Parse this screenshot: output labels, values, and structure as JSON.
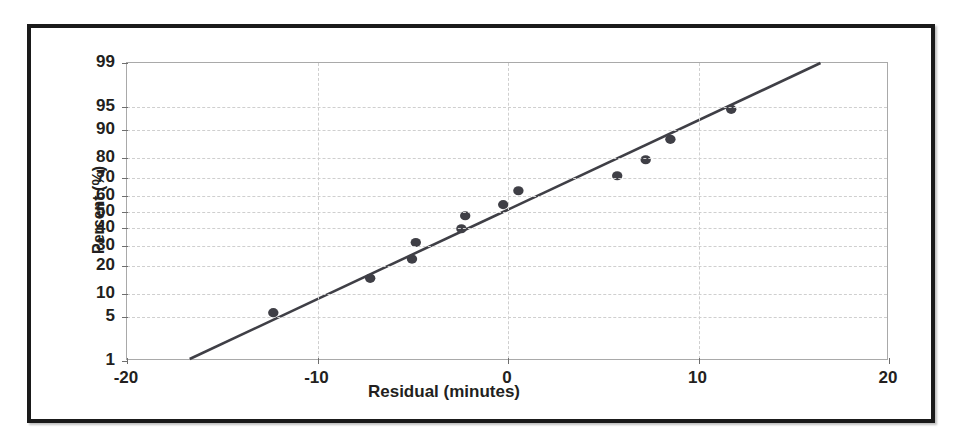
{
  "chart_data": {
    "type": "scatter",
    "title": "",
    "subtitle": "",
    "xlabel": "Residual (minutes)",
    "ylabel": "Percent (%)",
    "xlim": [
      -20,
      20
    ],
    "ylim": [
      1,
      99
    ],
    "y_scale": "normal-probability",
    "grid": true,
    "legend_position": "none",
    "x_ticks": [
      -20,
      -10,
      0,
      10,
      20
    ],
    "x_tick_labels": [
      "-20",
      "-10",
      "0",
      "10",
      "20"
    ],
    "y_ticks": [
      1,
      5,
      10,
      20,
      30,
      40,
      50,
      60,
      70,
      80,
      90,
      95,
      99
    ],
    "y_tick_labels": [
      "1",
      "5",
      "10",
      "20",
      "30",
      "40",
      "50",
      "60",
      "70",
      "80",
      "90",
      "95",
      "99"
    ],
    "series": [
      {
        "name": "Residual percentiles",
        "marker": "filled-circle",
        "color": "#3f3f46",
        "x": [
          -12.3,
          -7.2,
          -5.0,
          -4.8,
          -2.4,
          -2.2,
          -0.2,
          0.6,
          5.8,
          7.3,
          8.6,
          11.8
        ],
        "y": [
          5.5,
          14.5,
          22.5,
          31.0,
          39.0,
          47.0,
          54.0,
          62.5,
          71.0,
          79.0,
          87.0,
          94.5
        ]
      },
      {
        "name": "Normal reference line",
        "marker": "none",
        "line": "solid",
        "color": "#3f3f46",
        "x": [
          -16.7,
          16.5
        ],
        "y": [
          1,
          99
        ]
      }
    ],
    "colors": {
      "marker": "#3f3f46",
      "line": "#3f3f46",
      "grid": "#cfcfcf",
      "axis": "#a9a9a9",
      "text": "#231f20",
      "frame": "#1a1a1a",
      "background": "#ffffff"
    }
  }
}
